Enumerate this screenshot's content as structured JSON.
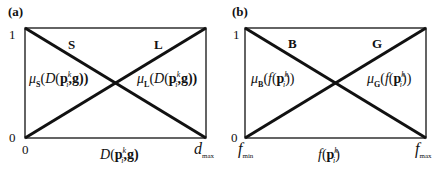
{
  "figure": {
    "panels": [
      {
        "tag": "(a)",
        "y_ticks": {
          "top": "1",
          "bottom": "0"
        },
        "x_ticks": {
          "left": "0",
          "right_main": "d",
          "right_sub": "max"
        },
        "x_label": {
          "main": "D",
          "open": "(",
          "p": "p",
          "sup": "k",
          "sub": "i",
          "rest": ",g)"
        },
        "sets": [
          {
            "name": "S",
            "shape": "decreasing"
          },
          {
            "name": "L",
            "shape": "increasing"
          }
        ],
        "memberships": [
          {
            "mu": "μ",
            "sub": "S",
            "open": "(",
            "D": "D",
            "paren": "(",
            "p": "p",
            "sup": "k",
            "subi": "i",
            "rest": ",g))"
          },
          {
            "mu": "μ",
            "sub": "L",
            "open": "(",
            "D": "D",
            "paren": "(",
            "p": "p",
            "sup": "k",
            "subi": "i",
            "rest": ",g))"
          }
        ]
      },
      {
        "tag": "(b)",
        "y_ticks": {
          "top": "1",
          "bottom": "0"
        },
        "x_ticks": {
          "left_main": "f",
          "left_sub": "min",
          "right_main": "f",
          "right_sub": "max"
        },
        "x_label": {
          "main": "f",
          "open": "(",
          "p": "p",
          "sup": "k",
          "sub": "i",
          "rest": ")"
        },
        "sets": [
          {
            "name": "B",
            "shape": "decreasing"
          },
          {
            "name": "G",
            "shape": "increasing"
          }
        ],
        "memberships": [
          {
            "mu": "μ",
            "sub": "B",
            "open": "(",
            "f": "f",
            "paren": "(",
            "p": "p",
            "sup": "k",
            "subi": "i",
            "rest": "))"
          },
          {
            "mu": "μ",
            "sub": "G",
            "open": "(",
            "f": "f",
            "paren": "(",
            "p": "p",
            "sup": "k",
            "subi": "i",
            "rest": "))"
          }
        ]
      }
    ],
    "colors": {
      "line": "#111111",
      "background": "#ffffff"
    }
  }
}
